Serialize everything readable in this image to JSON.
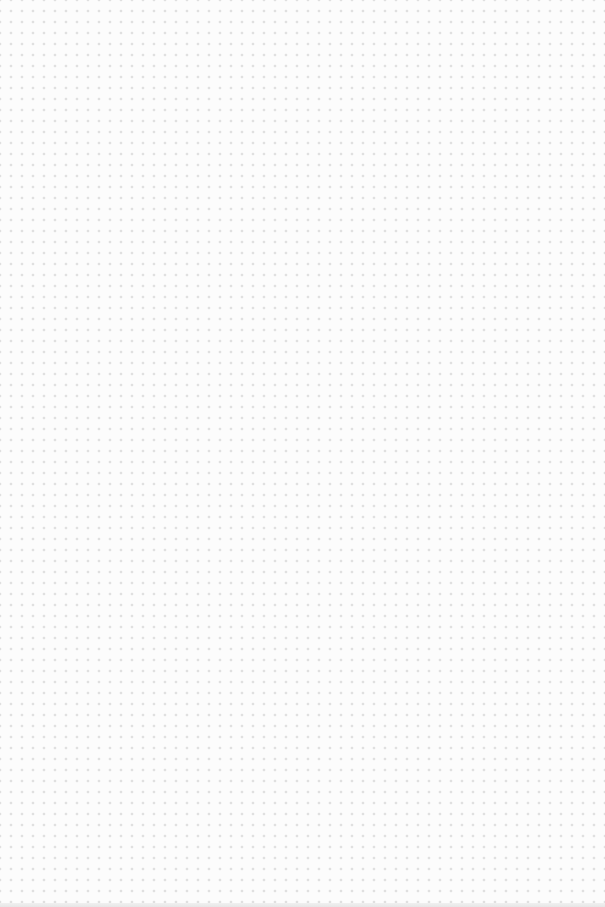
{
  "page": {
    "type": "dot-grid",
    "dot_spacing_px": 11,
    "dot_color": "#b8b8b8",
    "background_color": "#fcfcfc",
    "columns": 54,
    "rows": 81
  }
}
